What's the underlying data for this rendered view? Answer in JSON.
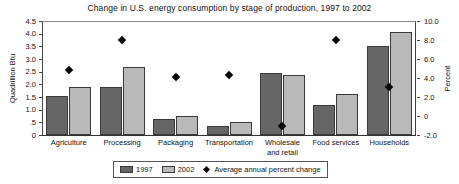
{
  "chart_data": {
    "type": "bar",
    "title": "Change in U.S. energy consumption by stage of production, 1997 to 2002",
    "xlabel": "",
    "ylabel": "Quadrillion Btu",
    "y2label": "Percent",
    "ylim": [
      0,
      4.5
    ],
    "y2lim": [
      -2.0,
      10.0
    ],
    "grid": false,
    "legend_position": "bottom",
    "categories": [
      "Agriculture",
      "Processing",
      "Packaging",
      "Transportation",
      "Wholesale and retail",
      "Food services",
      "Households"
    ],
    "yticks": [
      "0",
      ".5",
      "1.0",
      "1.5",
      "2.0",
      "2.5",
      "3.0",
      "3.5",
      "4.0",
      "4.5"
    ],
    "y2ticks": [
      "-2.0",
      "0",
      "2.0",
      "4.0",
      "6.0",
      "8.0",
      "10.0"
    ],
    "series": [
      {
        "name": "1997",
        "axis": "left",
        "color": "#666666",
        "values": [
          1.55,
          1.9,
          0.65,
          0.35,
          2.45,
          1.2,
          3.5
        ]
      },
      {
        "name": "2002",
        "axis": "left",
        "color": "#b9b9b9",
        "values": [
          1.9,
          2.7,
          0.75,
          0.5,
          2.35,
          1.6,
          4.05
        ]
      },
      {
        "name": "Average annual percent change",
        "axis": "right",
        "type": "scatter",
        "marker": "diamond",
        "color": "#000000",
        "values": [
          4.8,
          8.0,
          4.1,
          4.3,
          -1.0,
          8.0,
          3.1
        ]
      }
    ]
  },
  "legend": {
    "items": [
      {
        "label": "1997",
        "marker": "square-dark"
      },
      {
        "label": "2002",
        "marker": "square-light"
      },
      {
        "label": "Average annual percent change",
        "marker": "diamond"
      }
    ]
  }
}
